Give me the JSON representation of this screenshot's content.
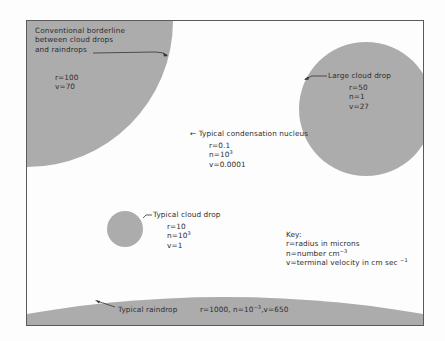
{
  "colors": {
    "fill": "#acacac",
    "background": "#fdfdfd",
    "frame": "#5a5a5a",
    "text": "#2e2e2e"
  },
  "drops": [
    {
      "id": "borderline",
      "label_lines": [
        "Conventional borderline",
        "between cloud drops",
        "and raindrops"
      ],
      "values": [
        "r=100",
        "v=70"
      ]
    },
    {
      "id": "large-cloud-drop",
      "label": "Large cloud drop",
      "values": [
        "r=50",
        "n=1",
        "v=27"
      ]
    },
    {
      "id": "condensation-nucleus",
      "label": "Typical condensation nucleus",
      "values": [
        "r=0.1",
        "n=10",
        "v=0.0001"
      ],
      "n_exp": "3"
    },
    {
      "id": "typical-cloud-drop",
      "label": "Typical cloud drop",
      "values": [
        "r=10",
        "n=10",
        "v=1"
      ],
      "n_exp": "3"
    },
    {
      "id": "typical-raindrop",
      "label": "Typical raindrop",
      "values_text": "r=1000, n=10",
      "n_exp": "−3",
      "v_text": ",v=650"
    }
  ],
  "key": {
    "title": "Key:",
    "lines": [
      {
        "text": "r=radius in microns",
        "exp": ""
      },
      {
        "text": "n=number cm",
        "exp": "−3"
      },
      {
        "text": "v=terminal velocity in cm sec",
        "exp": "−1"
      }
    ]
  },
  "arrow_glyph": "←"
}
